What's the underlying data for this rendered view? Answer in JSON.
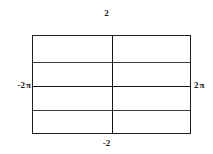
{
  "figure": {
    "name": "trig-plot",
    "background": "#ffffff",
    "line_color": "#1d1d1d"
  },
  "labels": {
    "top": "2",
    "bottom": "-2",
    "left_number": "-2",
    "left_unit": "π",
    "right_number": "2",
    "right_unit": "π"
  },
  "chart_data": {
    "type": "line",
    "title": "",
    "xlabel": "",
    "ylabel": "",
    "xlim": [
      -6.283185,
      6.283185
    ],
    "ylim": [
      -2,
      2
    ],
    "xticks": [
      -6.283185,
      6.283185
    ],
    "xticklabels": [
      "-2 π",
      "2 π"
    ],
    "yticks": [
      -2,
      2
    ],
    "yticklabels": [
      "-2",
      "2"
    ],
    "grid": false,
    "legend": false,
    "frame": true,
    "series": [
      {
        "name": "upper-plateau",
        "y_constant": 1.0,
        "x": [
          -6.283185,
          6.283185
        ],
        "values": [
          1.0,
          1.0
        ]
      },
      {
        "name": "center-axis",
        "y_constant": 0.0,
        "x": [
          -6.283185,
          6.283185
        ],
        "values": [
          0.0,
          0.0
        ]
      },
      {
        "name": "lower-plateau",
        "y_constant": -1.0,
        "x": [
          -6.283185,
          6.283185
        ],
        "values": [
          -1.0,
          -1.0
        ]
      }
    ],
    "vertical_lines": [
      {
        "name": "y-axis",
        "x": 0.0
      }
    ]
  },
  "geometry": {
    "frame_left_px": 32,
    "frame_top_px": 35,
    "frame_width_px": 159,
    "frame_height_px": 99,
    "hline_offsets_px": [
      26,
      50,
      74
    ],
    "vline_offset_px": 79
  }
}
